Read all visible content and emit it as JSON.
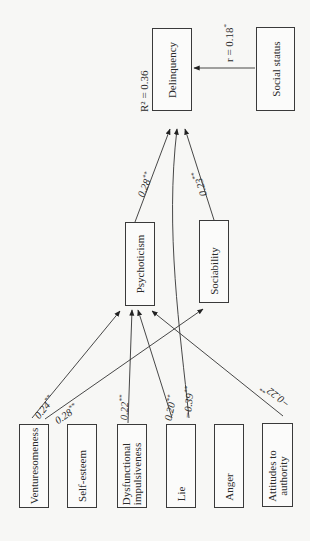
{
  "diagram": {
    "type": "path-model",
    "orientation": "rotated-90-ccw",
    "nodes": {
      "delinquency": "Delinquency",
      "social_status": "Social status",
      "psychoticism": "Psychoticism",
      "sociability": "Sociability",
      "venturesomeness": "Venturesomeness",
      "self_esteem": "Self-esteem",
      "dysfunctional_1": "Dysfunctional",
      "dysfunctional_2": "impulsiveness",
      "lie": "Lie",
      "anger": "Anger",
      "attitudes_1": "Attitudes to",
      "attitudes_2": "authority"
    },
    "annotations": {
      "r_squared": "R² = 0.36",
      "r_social": "r = 0.18",
      "r_social_sig": "*"
    },
    "edges": [
      {
        "from": "Venturesomeness",
        "to": "Psychoticism",
        "label": "0.24",
        "sig": "**"
      },
      {
        "from": "Venturesomeness",
        "to": "Sociability",
        "label": "0.28",
        "sig": "**"
      },
      {
        "from": "Dysfunctional impulsiveness",
        "to": "Psychoticism",
        "label": "0.22",
        "sig": "**"
      },
      {
        "from": "Lie",
        "to": "Psychoticism",
        "label": "0.20",
        "sig": "**"
      },
      {
        "from": "Lie",
        "to": "Delinquency",
        "label": "−0.39",
        "sig": "**"
      },
      {
        "from": "Attitudes to authority",
        "to": "Psychoticism",
        "label": "−0.22",
        "sig": "**"
      },
      {
        "from": "Psychoticism",
        "to": "Delinquency",
        "label": "0.28",
        "sig": "**"
      },
      {
        "from": "Sociability",
        "to": "Delinquency",
        "label": "0.23",
        "sig": "**"
      },
      {
        "from": "Social status",
        "to": "Delinquency",
        "label": "r = 0.18",
        "sig": "*"
      }
    ]
  }
}
